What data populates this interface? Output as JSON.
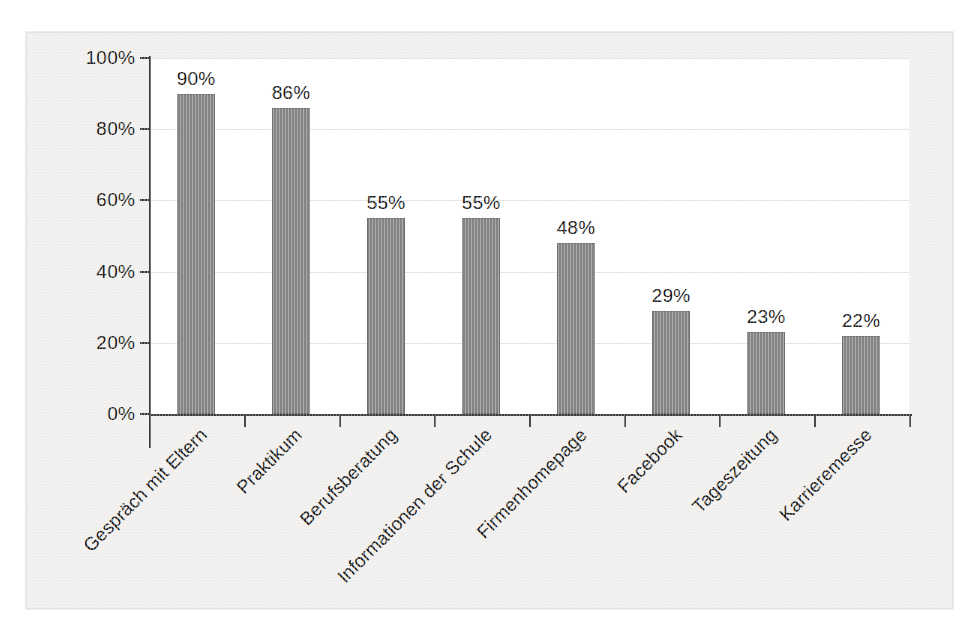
{
  "chart_data": {
    "type": "bar",
    "title": "",
    "subtitle": "",
    "xlabel": "",
    "ylabel": "",
    "ylim": [
      0,
      100
    ],
    "grid": true,
    "legend": "none",
    "y_ticks": [
      "0%",
      "20%",
      "40%",
      "60%",
      "80%",
      "100%"
    ],
    "y_tick_values": [
      0,
      20,
      40,
      60,
      80,
      100
    ],
    "categories": [
      "Gespräch mit Eltern",
      "Praktikum",
      "Berufsberatung",
      "Informationen der Schule",
      "Firmenhomepage",
      "Facebook",
      "Tageszeitung",
      "Karrieremesse"
    ],
    "values": [
      90,
      86,
      55,
      55,
      48,
      29,
      23,
      22
    ],
    "data_labels": [
      "90%",
      "86%",
      "55%",
      "55%",
      "48%",
      "29%",
      "23%",
      "22%"
    ],
    "bar_color": "#848484",
    "bar_border_color": "#6f6f6f",
    "axis_color": "#3c3c3c",
    "gridline_color": "#e2e2e2",
    "background_color": "#f3f2f0",
    "plot_background_color": "#ffffff"
  }
}
